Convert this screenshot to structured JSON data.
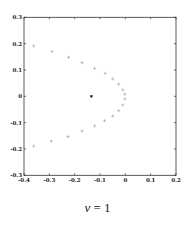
{
  "chart_data": {
    "type": "scatter",
    "title": "",
    "xlabel": "",
    "ylabel": "",
    "xlim": [
      -0.4,
      0.2
    ],
    "ylim": [
      -0.3,
      0.3
    ],
    "xticks": [
      -0.4,
      -0.3,
      -0.2,
      -0.1,
      0,
      0.1,
      0.2
    ],
    "xtick_labels": [
      "-0.4",
      "-0.3",
      "-0.2",
      "-0.1",
      "0",
      "0.1",
      "0.2"
    ],
    "yticks": [
      -0.3,
      -0.2,
      -0.1,
      0,
      0.1,
      0.2,
      0.3
    ],
    "ytick_labels": [
      "-0.3",
      "-0.2",
      "-0.1",
      "0",
      "0.1",
      "0.2",
      "0.3"
    ],
    "grid": false,
    "series": [
      {
        "name": "eigenvalues",
        "marker": "plus",
        "color": "#9a9a9a",
        "x": [
          -0.362,
          -0.29,
          -0.224,
          -0.171,
          -0.121,
          -0.08,
          -0.05,
          -0.026,
          -0.01,
          -0.002,
          -0.002,
          -0.01,
          -0.026,
          -0.05,
          -0.082,
          -0.121,
          -0.171,
          -0.226,
          -0.292,
          -0.362
        ],
        "y": [
          0.191,
          0.17,
          0.148,
          0.128,
          0.106,
          0.087,
          0.066,
          0.046,
          0.024,
          0.008,
          -0.01,
          -0.033,
          -0.055,
          -0.075,
          -0.093,
          -0.113,
          -0.132,
          -0.153,
          -0.17,
          -0.189
        ]
      },
      {
        "name": "center",
        "marker": "dot",
        "color": "#111111",
        "x": [
          -0.134
        ],
        "y": [
          0
        ]
      }
    ]
  },
  "caption": {
    "symbol": "ν",
    "rest": " = 1"
  }
}
